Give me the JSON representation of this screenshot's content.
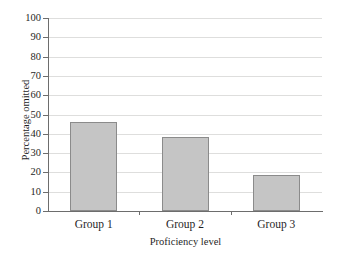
{
  "chart_data": {
    "type": "bar",
    "title": "",
    "subtitle": "",
    "xlabel": "Proficiency level",
    "ylabel": "Percentage omitted",
    "categories": [
      "Group 1",
      "Group 2",
      "Group 3"
    ],
    "values": [
      46,
      38.5,
      18.5
    ],
    "series": [
      {
        "name": "Percentage omitted",
        "values": [
          46,
          38.5,
          18.5
        ]
      }
    ],
    "ylim": [
      0,
      100
    ],
    "ytick_step": 10,
    "yticks": [
      0,
      10,
      20,
      30,
      40,
      50,
      60,
      70,
      80,
      90,
      100
    ],
    "ytick_labels": [
      "0",
      "10",
      "20",
      "30",
      "40",
      "50",
      "60",
      "70",
      "80",
      "90",
      "100"
    ],
    "xtick_labels": [
      "Group 1",
      "Group 2",
      "Group 3"
    ],
    "grid": "horizontal",
    "legend": "none",
    "annotations": [],
    "bar_fill_color": "#c5c5c5",
    "bar_edge_color": "#8b8b8b",
    "axis_color": "#6d6d6d",
    "gridline_color": "#dededd",
    "background_color": "#ffffff"
  }
}
